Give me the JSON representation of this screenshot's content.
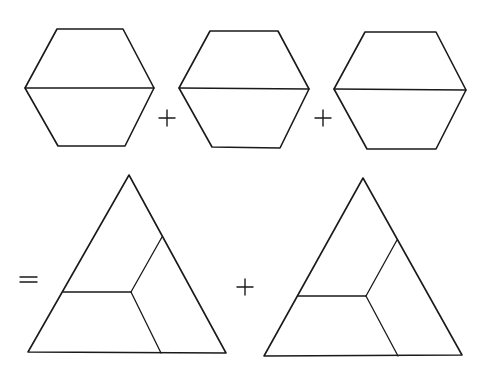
{
  "diagram": {
    "stroke_color": "#1a1a1a",
    "background_color": "#ffffff",
    "hexagons": [
      {
        "id": "hexagon-1",
        "points": [
          [
            57,
            29
          ],
          [
            123,
            29
          ],
          [
            154,
            88
          ],
          [
            125,
            146
          ],
          [
            58,
            146
          ],
          [
            25,
            88
          ]
        ],
        "divider": [
          [
            25,
            88
          ],
          [
            154,
            88
          ]
        ]
      },
      {
        "id": "hexagon-2",
        "points": [
          [
            210,
            31
          ],
          [
            278,
            31
          ],
          [
            309,
            89
          ],
          [
            280,
            148
          ],
          [
            212,
            147
          ],
          [
            179,
            88
          ]
        ],
        "divider": [
          [
            179,
            88
          ],
          [
            309,
            89
          ]
        ]
      },
      {
        "id": "hexagon-3",
        "points": [
          [
            365,
            32
          ],
          [
            436,
            32
          ],
          [
            466,
            90
          ],
          [
            436,
            149
          ],
          [
            367,
            149
          ],
          [
            334,
            89
          ]
        ],
        "divider": [
          [
            334,
            89
          ],
          [
            466,
            90
          ]
        ]
      }
    ],
    "operators_top": [
      {
        "id": "plus-1",
        "symbol": "+",
        "center": [
          167,
          118
        ]
      },
      {
        "id": "plus-2",
        "symbol": "+",
        "center": [
          323,
          118
        ]
      }
    ],
    "equals": {
      "symbol": "=",
      "x1": 20,
      "x2": 37,
      "y1": 277,
      "y2": 282
    },
    "triangles": [
      {
        "id": "triangle-1",
        "apex": [
          129,
          175
        ],
        "bottom_left": [
          28,
          352
        ],
        "bottom_right": [
          226,
          353
        ],
        "inner": [
          131,
          292
        ],
        "left_cut": [
          63,
          292
        ],
        "right_cut": [
          162,
          237
        ],
        "bottom_cut": [
          161,
          353
        ]
      },
      {
        "id": "triangle-2",
        "apex": [
          363,
          178
        ],
        "bottom_left": [
          264,
          356
        ],
        "bottom_right": [
          462,
          355
        ],
        "inner": [
          366,
          296
        ],
        "left_cut": [
          298,
          296
        ],
        "right_cut": [
          397,
          240
        ],
        "bottom_cut": [
          398,
          356
        ]
      }
    ],
    "operator_bottom": {
      "id": "plus-3",
      "symbol": "+",
      "center": [
        245,
        287
      ]
    }
  }
}
